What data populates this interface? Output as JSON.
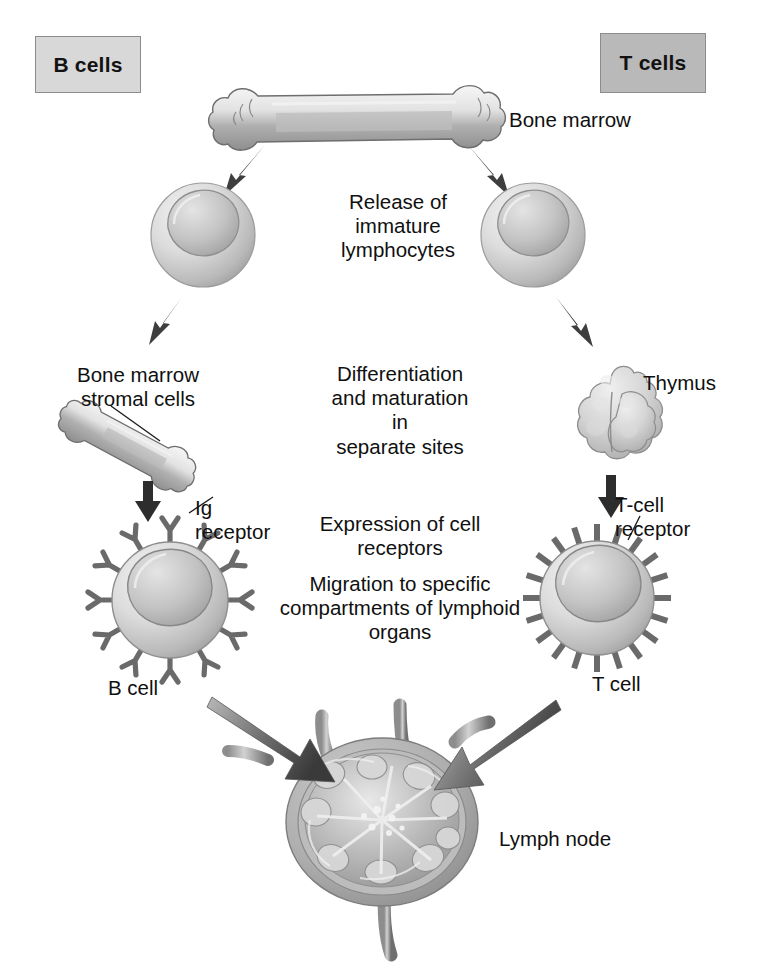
{
  "diagram": {
    "background": "#ffffff",
    "columns": {
      "left": {
        "header": "B cells",
        "header_bg": "#d8d8d8"
      },
      "right": {
        "header": "T cells",
        "header_bg": "#b9b9b9"
      }
    },
    "labels": {
      "bone_marrow": "Bone marrow",
      "release": "Release of\nimmature\nlymphocytes",
      "stromal_cells": "Bone marrow\nstromal cells",
      "differentiation": "Differentiation\nand maturation\nin\nseparate sites",
      "thymus": "Thymus",
      "ig_receptor": "Ig\nreceptor",
      "tcell_receptor": "T-cell\nreceptor",
      "expression": "Expression of cell\nreceptors",
      "migration": "Migration to specific\ncompartments of lymphoid\norgans",
      "b_cell": "B cell",
      "t_cell": "T cell",
      "lymph_node": "Lymph node"
    },
    "icons": {
      "bone_top": "long-bone-icon",
      "bone_stromal": "small-bone-icon",
      "immature_left": "immature-lymphocyte-icon",
      "immature_right": "immature-lymphocyte-icon",
      "thymus": "thymus-organ-icon",
      "b_cell": "b-cell-with-ig-receptors-icon",
      "t_cell": "t-cell-with-tcr-receptors-icon",
      "lymph_node": "lymph-node-cross-section-icon"
    },
    "colors": {
      "ink": "#101010",
      "arrow": "#3c3c3c",
      "cell_fill": "#cfcfcf",
      "nucleus": "#a8a8a8",
      "bone": "#dcdcdc",
      "node_capsule": "#9e9e9e",
      "box_border": "#8c8c8c"
    },
    "flow": {
      "steps": [
        "Bone marrow",
        "Release of immature lymphocytes",
        "Differentiation and maturation in separate sites",
        "Expression of cell receptors",
        "Migration to specific compartments of lymphoid organs",
        "Lymph node"
      ],
      "arrow_count": 9
    }
  }
}
